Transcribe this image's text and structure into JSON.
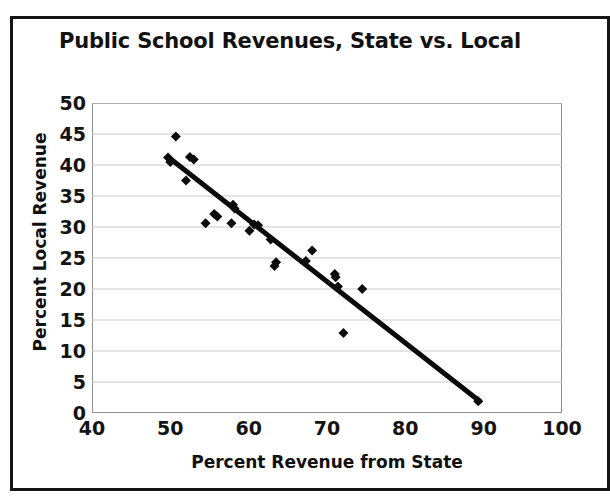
{
  "chart_data": {
    "type": "scatter",
    "title": "Public School Revenues, State vs. Local",
    "xlabel": "Percent Revenue from State",
    "ylabel": "Percent Local Revenue",
    "xlim": [
      40,
      100
    ],
    "ylim": [
      0,
      50
    ],
    "xticks": [
      40,
      50,
      60,
      70,
      80,
      90,
      100
    ],
    "yticks": [
      0,
      5,
      10,
      15,
      20,
      25,
      30,
      35,
      40,
      45,
      50
    ],
    "grid": "horizontal",
    "legend": null,
    "marker": "diamond",
    "marker_color": "#0d0d0d",
    "trendline": {
      "label": "linear trend",
      "color": "#0b0b0b",
      "x_start": 49.8,
      "y_start": 41.2,
      "x_end": 89.5,
      "y_end": 1.9
    },
    "points": [
      {
        "x": 50.7,
        "y": 44.6
      },
      {
        "x": 49.7,
        "y": 41.2
      },
      {
        "x": 50.0,
        "y": 40.5
      },
      {
        "x": 52.5,
        "y": 41.3
      },
      {
        "x": 53.0,
        "y": 40.9
      },
      {
        "x": 52.0,
        "y": 37.5
      },
      {
        "x": 58.0,
        "y": 33.6
      },
      {
        "x": 58.2,
        "y": 33.0
      },
      {
        "x": 55.6,
        "y": 32.1
      },
      {
        "x": 56.0,
        "y": 31.7
      },
      {
        "x": 54.5,
        "y": 30.6
      },
      {
        "x": 57.8,
        "y": 30.6
      },
      {
        "x": 60.7,
        "y": 30.4
      },
      {
        "x": 61.2,
        "y": 30.3
      },
      {
        "x": 60.1,
        "y": 29.4
      },
      {
        "x": 62.8,
        "y": 28.0
      },
      {
        "x": 63.5,
        "y": 24.3
      },
      {
        "x": 63.3,
        "y": 23.7
      },
      {
        "x": 68.1,
        "y": 26.2
      },
      {
        "x": 67.3,
        "y": 24.5
      },
      {
        "x": 71.0,
        "y": 22.4
      },
      {
        "x": 71.1,
        "y": 21.9
      },
      {
        "x": 71.4,
        "y": 20.4
      },
      {
        "x": 74.5,
        "y": 20.0
      },
      {
        "x": 72.1,
        "y": 12.9
      },
      {
        "x": 89.3,
        "y": 1.9
      }
    ]
  },
  "axis": {
    "y_labels": [
      "50",
      "45",
      "40",
      "35",
      "30",
      "25",
      "20",
      "15",
      "10",
      "5",
      "0"
    ],
    "x_labels": [
      "40",
      "50",
      "60",
      "70",
      "80",
      "90",
      "100"
    ]
  }
}
